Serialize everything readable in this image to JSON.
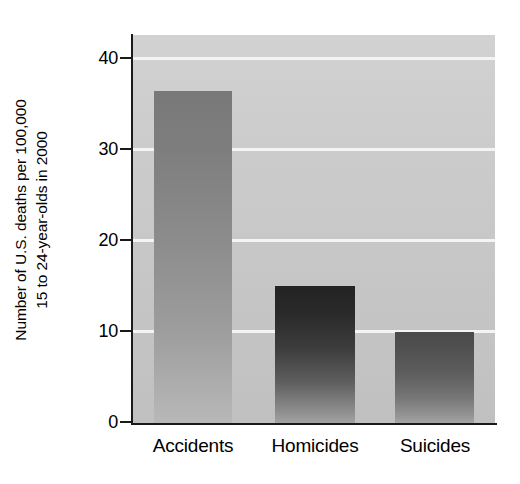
{
  "chart_data": {
    "type": "bar",
    "title": "",
    "subtitle": "",
    "xlabel": "",
    "ylabel_lines": [
      "Number of U.S. deaths per 100,000",
      "15 to 24-year-olds in 2000"
    ],
    "ylabel": "Number of U.S. deaths per 100,000 15 to 24-year-olds in 2000",
    "categories": [
      "Accidents",
      "Homicides",
      "Suicides"
    ],
    "values": [
      36.5,
      15,
      10
    ],
    "ylim": [
      0,
      42.5
    ],
    "yticks": [
      0,
      10,
      20,
      30,
      40
    ],
    "ytick_labels": [
      "0",
      "10",
      "20",
      "30",
      "40"
    ],
    "grid": true,
    "grid_axis": "y",
    "grid_color": "#f4f4f4",
    "legend": false,
    "legend_position": "none",
    "plot_background": "#c9c9c9",
    "bar_colors": [
      "#8c8c8c",
      "#3c3c3c",
      "#5d5d5d"
    ],
    "axis_color": "#1a1a1a"
  },
  "geometry": {
    "plot": {
      "left": 133,
      "top": 35,
      "width": 362,
      "height": 388
    },
    "y_zero_px": 388,
    "px_per_unit": 9.1,
    "bars": [
      {
        "left": 21,
        "width": 78
      },
      {
        "left": 142,
        "width": 80
      },
      {
        "left": 262,
        "width": 79
      }
    ],
    "tick_y_px": [
      422,
      331,
      240,
      149,
      58
    ],
    "catlabel_centers": [
      60,
      182,
      302
    ]
  }
}
